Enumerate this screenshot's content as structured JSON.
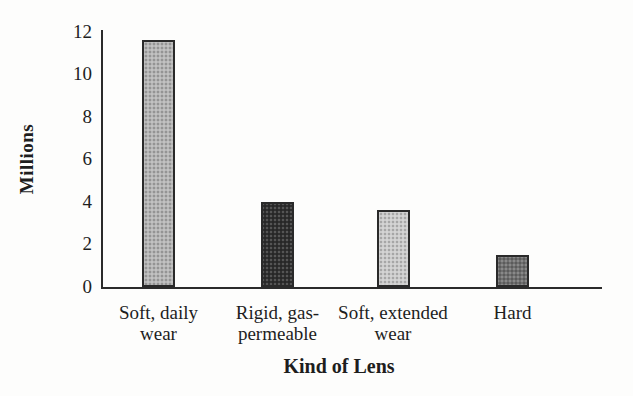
{
  "figure": {
    "background": "#fdfdfc",
    "axis_color": "#2b2b2b",
    "text_color": "#1e1e1e"
  },
  "chart_data": {
    "type": "bar",
    "title": "",
    "xlabel": "Kind of Lens",
    "ylabel": "Millions",
    "categories": [
      "Soft, daily wear",
      "Rigid, gas-permeable",
      "Soft, extended wear",
      "Hard"
    ],
    "values": [
      11.6,
      4.0,
      3.6,
      1.5
    ],
    "bar_colors": [
      "#b5b5b5",
      "#2f2f2f",
      "#cbcbcb",
      "#6f6f6f"
    ],
    "bar_outline_color": "#2a2a2a",
    "ylim": [
      0,
      12
    ],
    "yticks": [
      12,
      10,
      8,
      6,
      4,
      2,
      0
    ],
    "grid": false,
    "legend": false
  }
}
